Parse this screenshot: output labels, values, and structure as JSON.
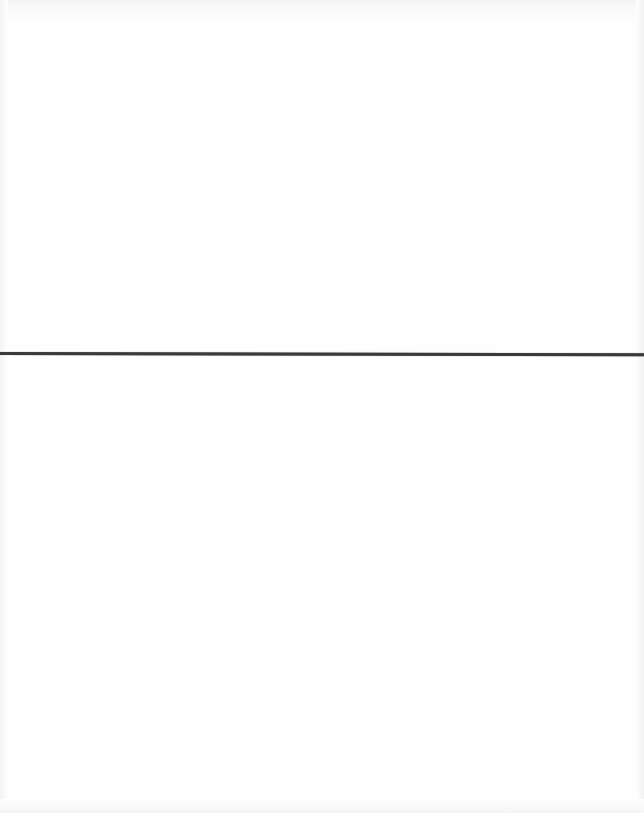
{
  "document": {
    "type": "blank-scanned-page",
    "background_color": "#fefefe",
    "divider": {
      "color": "#3a3a3a",
      "y": 352,
      "thickness": 3
    },
    "text": []
  }
}
